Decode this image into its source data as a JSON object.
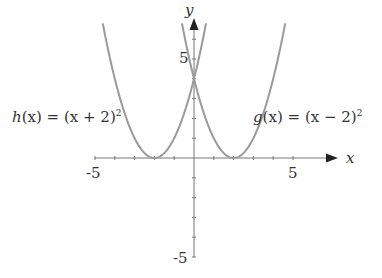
{
  "chart_data": {
    "type": "line",
    "title": "",
    "xlabel": "x",
    "ylabel": "y",
    "xlim": [
      -5,
      6.2
    ],
    "ylim": [
      -5,
      6.8
    ],
    "x_ticks": [
      -5,
      -4,
      -3,
      -2,
      -1,
      0,
      1,
      2,
      3,
      4,
      5
    ],
    "y_ticks": [
      -5,
      -4,
      -3,
      -2,
      -1,
      0,
      1,
      2,
      3,
      4,
      5,
      6
    ],
    "x_tick_labels": {
      "-5": "-5",
      "5": "5"
    },
    "y_tick_labels": {
      "-5": "-5",
      "5": "5"
    },
    "grid": false,
    "series": [
      {
        "name": "h(x) = (x + 2)^2",
        "formula": "(x+2)^2",
        "vertex": [
          -2,
          0
        ],
        "y_intercept": 4,
        "color": "#9a9a9a"
      },
      {
        "name": "g(x) = (x − 2)^2",
        "formula": "(x-2)^2",
        "vertex": [
          2,
          0
        ],
        "y_intercept": 4,
        "color": "#9a9a9a"
      }
    ],
    "annotations": [
      {
        "text": "h(x) = (x + 2)²",
        "position": "left of left parabola"
      },
      {
        "text": "g(x) = (x − 2)²",
        "position": "right of right parabola"
      }
    ]
  },
  "labels": {
    "x_axis": "x",
    "y_axis": "y",
    "x_min": "-5",
    "x_max": "5",
    "y_min": "-5",
    "y_max": "5",
    "h_func": "h",
    "h_rest": "(x) = (x + 2)",
    "g_func": "g",
    "g_rest": "(x) = (x − 2)",
    "sq": "2"
  },
  "colors": {
    "axis": "#777777",
    "curve": "#9a9a9a",
    "text": "#333333"
  }
}
